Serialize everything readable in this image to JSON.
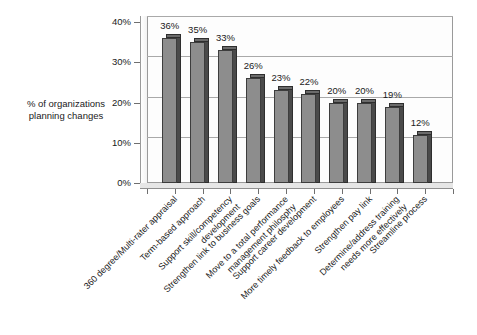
{
  "chart_data": {
    "type": "bar",
    "title": "",
    "subtitle": "",
    "xlabel": "",
    "ylabel": "% of organizations\nplanning changes",
    "ylim": [
      0,
      40
    ],
    "grid": true,
    "legend": false,
    "orientation": "vertical",
    "value_suffix": "%",
    "categories": [
      "360 degree/Multi-rater appraisal",
      "Term-based approach",
      "Support skill/competency\ndevelopment",
      "Strengthen link to business goals",
      "Move to a total performance\nmanagement philosphy",
      "Support career development",
      "More timely feedback to employees",
      "Strengthen pay link",
      "Determine/address training\nneeds more effectively",
      "Streamline process"
    ],
    "values": [
      36,
      35,
      33,
      26,
      23,
      22,
      20,
      20,
      19,
      12
    ],
    "value_labels": [
      "36%",
      "35%",
      "33%",
      "26%",
      "23%",
      "22%",
      "20%",
      "20%",
      "19%",
      "12%"
    ],
    "yticks": [
      0,
      10,
      20,
      30,
      40
    ],
    "ytick_labels": [
      "0%",
      "10%",
      "20%",
      "30%",
      "40%"
    ],
    "colors": {
      "bar_front": "#8d8d8d",
      "bar_side": "#4a4a4a",
      "bar_top": "#6b6b6b",
      "bar_outline": "#3d3d3d",
      "gridline": "#a9a9a9",
      "plot_background": "#fdfdfd",
      "frame": "#9a9a9a",
      "text": "#1a1a1a",
      "page_background": "#ffffff"
    }
  }
}
